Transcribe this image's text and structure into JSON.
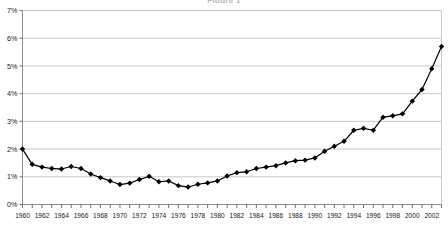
{
  "chart_data": {
    "type": "line",
    "title": "Figure 1",
    "xlabel": "",
    "ylabel": "",
    "ylim": [
      0,
      7
    ],
    "xlim": [
      1960,
      2003
    ],
    "ytick_values": [
      0,
      1,
      2,
      3,
      4,
      5,
      6,
      7
    ],
    "ytick_labels": [
      "0%",
      "1%",
      "2%",
      "3%",
      "4%",
      "5%",
      "6%",
      "7%"
    ],
    "xtick_labels": [
      "1960",
      "1962",
      "1964",
      "1966",
      "1968",
      "1970",
      "1972",
      "1974",
      "1976",
      "1978",
      "1980",
      "1982",
      "1984",
      "1986",
      "1988",
      "1990",
      "1992",
      "1994",
      "1996",
      "1998",
      "2000",
      "2002"
    ],
    "xtick_label_values": [
      1960,
      1962,
      1964,
      1966,
      1968,
      1970,
      1972,
      1974,
      1976,
      1978,
      1980,
      1982,
      1984,
      1986,
      1988,
      1990,
      1992,
      1994,
      1996,
      1998,
      2000,
      2002
    ],
    "grid": "horizontal",
    "legend": "none",
    "marker": "diamond",
    "line_color": "#000000",
    "marker_color": "#000000",
    "grid_color": "#c8c8c8",
    "axis_color": "#808080",
    "background_color": "#ffffff",
    "x": [
      1960,
      1961,
      1962,
      1963,
      1964,
      1965,
      1966,
      1967,
      1968,
      1969,
      1970,
      1971,
      1972,
      1973,
      1974,
      1975,
      1976,
      1977,
      1978,
      1979,
      1980,
      1981,
      1982,
      1983,
      1984,
      1985,
      1986,
      1987,
      1988,
      1989,
      1990,
      1991,
      1992,
      1993,
      1994,
      1995,
      1996,
      1997,
      1998,
      1999,
      2000,
      2001,
      2002,
      2003
    ],
    "values": [
      2.0,
      1.45,
      1.35,
      1.3,
      1.28,
      1.37,
      1.3,
      1.1,
      0.97,
      0.85,
      0.72,
      0.77,
      0.9,
      1.02,
      0.82,
      0.85,
      0.68,
      0.63,
      0.73,
      0.78,
      0.85,
      1.03,
      1.15,
      1.18,
      1.3,
      1.35,
      1.4,
      1.5,
      1.58,
      1.6,
      1.68,
      1.92,
      2.1,
      2.28,
      2.68,
      2.75,
      2.68,
      3.15,
      3.2,
      3.27,
      3.73,
      4.15,
      4.9,
      5.7
    ]
  }
}
